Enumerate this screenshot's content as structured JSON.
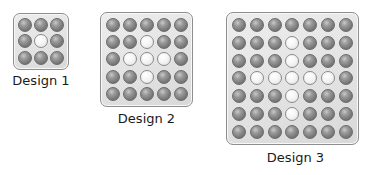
{
  "designs": [
    {
      "label": "Design 1",
      "size": 3,
      "white_cells": [
        [
          1,
          1
        ]
      ]
    },
    {
      "label": "Design 2",
      "size": 5,
      "white_cells": [
        [
          1,
          2
        ],
        [
          2,
          1
        ],
        [
          2,
          2
        ],
        [
          2,
          3
        ],
        [
          3,
          2
        ]
      ]
    },
    {
      "label": "Design 3",
      "size": 7,
      "white_cells": [
        [
          1,
          3
        ],
        [
          2,
          3
        ],
        [
          3,
          1
        ],
        [
          3,
          2
        ],
        [
          3,
          3
        ],
        [
          3,
          4
        ],
        [
          3,
          5
        ],
        [
          4,
          3
        ],
        [
          5,
          3
        ]
      ]
    }
  ],
  "colors": {
    "board_background": "#e4e4e4",
    "board_border": "#8e8e8e",
    "gray_ball": "#7a7a7a",
    "white_ball": "#f4f4f4"
  }
}
